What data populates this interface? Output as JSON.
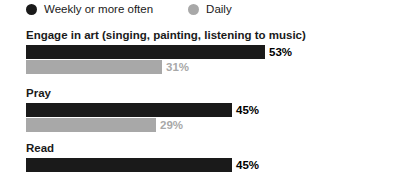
{
  "legend": {
    "items": [
      {
        "label": "Weekly or more often",
        "color": "#1a1a1a",
        "icon": "legend-dot-dark"
      },
      {
        "label": "Daily",
        "color": "#a8a8a8",
        "icon": "legend-dot-light"
      }
    ]
  },
  "chart_data": {
    "type": "bar",
    "title": "",
    "xlabel": "",
    "ylabel": "",
    "xlim": [
      0,
      100
    ],
    "grid": false,
    "legend_position": "top-left",
    "orientation": "horizontal",
    "value_suffix": "%",
    "px_per_percent": 4.51,
    "categories": [
      "Engage in art (singing, painting, listening to music)",
      "Pray",
      "Read"
    ],
    "series": [
      {
        "name": "Weekly or more often",
        "color": "#1a1a1a",
        "values": [
          53,
          45,
          45
        ]
      },
      {
        "name": "Daily",
        "color": "#a8a8a8",
        "values": [
          31,
          29,
          null
        ]
      }
    ],
    "groups": [
      {
        "label": "Engage in art (singing, painting, listening to music)",
        "bars": [
          {
            "series": "Weekly or more often",
            "value": 53,
            "value_label": "53%",
            "width_px": 239,
            "tone": "dark"
          },
          {
            "series": "Daily",
            "value": 31,
            "value_label": "31%",
            "width_px": 136,
            "tone": "light"
          }
        ]
      },
      {
        "label": "Pray",
        "bars": [
          {
            "series": "Weekly or more often",
            "value": 45,
            "value_label": "45%",
            "width_px": 206,
            "tone": "dark"
          },
          {
            "series": "Daily",
            "value": 29,
            "value_label": "29%",
            "width_px": 130,
            "tone": "light"
          }
        ]
      },
      {
        "label": "Read",
        "bars": [
          {
            "series": "Weekly or more often",
            "value": 45,
            "value_label": "45%",
            "width_px": 206,
            "tone": "dark"
          }
        ]
      }
    ]
  }
}
